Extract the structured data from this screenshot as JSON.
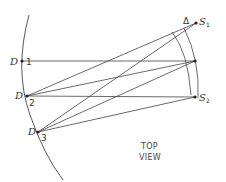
{
  "diagram": {
    "caption": [
      "TOP",
      "VIEW"
    ],
    "detectors": [
      {
        "letter": "D",
        "number": "1"
      },
      {
        "letter": "D",
        "number": "2"
      },
      {
        "letter": "D",
        "number": "3"
      }
    ],
    "sources": [
      {
        "letter": "S",
        "sub": "1"
      },
      {
        "letter": "S",
        "sub": "2"
      }
    ],
    "delta_label": "Δ",
    "colors": {
      "line": "#333333",
      "text": "#333333"
    }
  }
}
